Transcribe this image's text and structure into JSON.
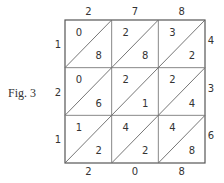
{
  "figure": {
    "caption": "Fig. 3",
    "type": "lattice-multiplication",
    "top_digits": [
      "2",
      "7",
      "8"
    ],
    "right_digits": [
      "4",
      "3",
      "6"
    ],
    "left_digits": [
      "1",
      "2",
      "1"
    ],
    "bottom_digits": [
      "2",
      "0",
      "8"
    ],
    "cells": [
      [
        {
          "upper": "0",
          "lower": "8"
        },
        {
          "upper": "2",
          "lower": "8"
        },
        {
          "upper": "3",
          "lower": "2"
        }
      ],
      [
        {
          "upper": "0",
          "lower": "6"
        },
        {
          "upper": "2",
          "lower": "1"
        },
        {
          "upper": "2",
          "lower": "4"
        }
      ],
      [
        {
          "upper": "1",
          "lower": "2"
        },
        {
          "upper": "4",
          "lower": "2"
        },
        {
          "upper": "4",
          "lower": "8"
        }
      ]
    ]
  }
}
